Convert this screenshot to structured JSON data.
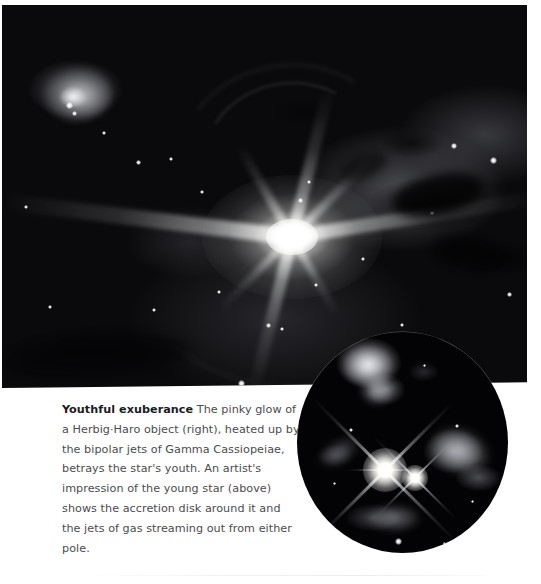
{
  "page": {
    "background_color": "#ffffff",
    "width": 541,
    "height": 584
  },
  "main_photo": {
    "name": "herbig-haro-object-photograph",
    "alt": "Wide-field monochrome astrophotograph of a brilliant young star with radiating light rays set in a dense starfield crossed by dark dust lanes and faint nebulosity",
    "background_color": "#0a0a0c",
    "highlight_color": "#ffffff",
    "features": [
      "dense starfield",
      "central bright star with radiating rays",
      "bright nebula patch upper left",
      "dark dust lanes on right",
      "diffuse nebulosity"
    ]
  },
  "inset_photo": {
    "name": "artists-impression-circular-inset",
    "alt": "Circular inset showing two brilliant stars with cross-shaped diffraction spikes amid glowing nebula clouds",
    "background_color": "#030305",
    "shape": "circle",
    "features": [
      "two bright diffraction-spiked stars",
      "glowing nebula clouds",
      "scattered faint stars"
    ]
  },
  "caption": {
    "lede": "Youthful exuberance",
    "body": " The pinky glow of a Herbig·Haro object (right), heated up by the bipolar jets of Gamma Cassiopeiae, betrays the star's youth. An artist's impression of the young star (above) shows the accretion disk around it and the jets of gas streaming out from either pole.",
    "text_color": "#4c4c4e",
    "lede_color": "#1b1b1d"
  }
}
